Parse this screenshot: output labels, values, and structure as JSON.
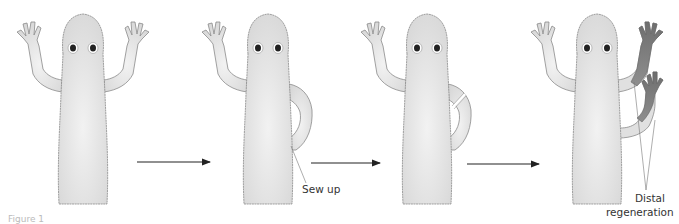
{
  "figure": {
    "panels": [
      {
        "id": "panel-1",
        "description": "intact salamander"
      },
      {
        "id": "panel-2",
        "description": "limb tip sewn into flank"
      },
      {
        "id": "panel-3",
        "description": "limb cut near shoulder"
      },
      {
        "id": "panel-4",
        "description": "both free ends regenerate distal structures"
      }
    ],
    "labels": {
      "sew_up": "Sew up",
      "distal": "Distal",
      "regeneration": "regeneration"
    },
    "caption": "Figure 1",
    "colors": {
      "body_fill": "#e3e3e3",
      "body_outline": "#8a8a8a",
      "regenerated_fill": "#7c7c7c",
      "arrow": "#222222",
      "label_text": "#333333"
    }
  }
}
